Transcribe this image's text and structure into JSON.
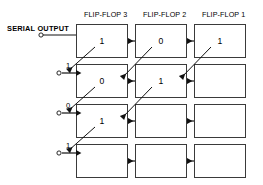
{
  "diagram": {
    "title_row": {
      "columns": [
        {
          "label": "FLIP-FLOP 3"
        },
        {
          "label": "FLIP-FLOP 2"
        },
        {
          "label": "FLIP-FLOP 1"
        }
      ]
    },
    "serial_output": {
      "label": "SERIAL OUTPUT"
    },
    "rows": [
      {
        "out_bit": "",
        "cells": [
          {
            "value": "1"
          },
          {
            "value": "0"
          },
          {
            "value": "1"
          }
        ]
      },
      {
        "out_bit": "1",
        "cells": [
          {
            "value": "0"
          },
          {
            "value": "1"
          },
          {
            "value": ""
          }
        ]
      },
      {
        "out_bit": "0",
        "cells": [
          {
            "value": "1"
          },
          {
            "value": ""
          },
          {
            "value": ""
          }
        ]
      },
      {
        "out_bit": "1",
        "cells": [
          {
            "value": ""
          },
          {
            "value": ""
          },
          {
            "value": ""
          }
        ]
      }
    ],
    "colors": {
      "stroke": "#3a3a3a",
      "text": "#000000",
      "background": "#ffffff"
    }
  }
}
